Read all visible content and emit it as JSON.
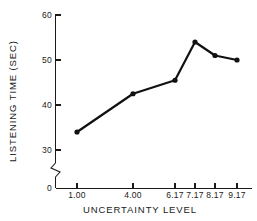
{
  "chart_data": {
    "type": "line",
    "title": "",
    "xlabel": "UNCERTAINTY LEVEL",
    "ylabel": "LISTENING TIME (SEC)",
    "categories": [
      "1.00",
      "4.00",
      "6.17",
      "7.17",
      "8.17",
      "9.17"
    ],
    "x": [
      1.0,
      4.0,
      6.17,
      7.17,
      8.17,
      9.17
    ],
    "values": [
      34,
      42.5,
      45.5,
      54,
      51,
      50
    ],
    "series": [
      {
        "name": "Listening time",
        "values": [
          34,
          42.5,
          45.5,
          54,
          51,
          50
        ]
      }
    ],
    "xtick_labels": [
      "1.00",
      "4.00",
      "6.17",
      "7.17",
      "8.17",
      "9.17"
    ],
    "ytick_labels": [
      "0",
      "30",
      "40",
      "50",
      "60"
    ],
    "ytick_values": [
      0,
      30,
      40,
      50,
      60
    ],
    "ylim": [
      30,
      60
    ],
    "axis_break": true,
    "axis_break_note": "y-axis broken between 0 and 30",
    "grid": false,
    "legend": "none",
    "marker": "filled-circle",
    "line_color": "#111111",
    "axis_color": "#1a1a1a",
    "background_color": "#ffffff"
  },
  "axes": {
    "y_title": "LISTENING TIME (SEC)",
    "x_title": "UNCERTAINTY LEVEL"
  }
}
